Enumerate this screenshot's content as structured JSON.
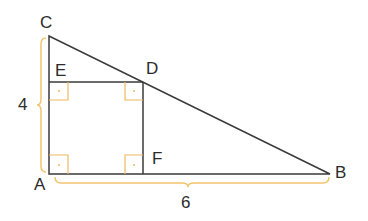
{
  "diagram": {
    "points": {
      "A": {
        "label": "A",
        "x": 49,
        "y": 174
      },
      "B": {
        "label": "B",
        "x": 330,
        "y": 174
      },
      "C": {
        "label": "C",
        "x": 49,
        "y": 36
      },
      "D": {
        "label": "D",
        "x": 143,
        "y": 82
      },
      "E": {
        "label": "E",
        "x": 49,
        "y": 82
      },
      "F": {
        "label": "F",
        "x": 143,
        "y": 174
      }
    },
    "dimensions": {
      "AC": "4",
      "AB": "6"
    },
    "colors": {
      "line": "#3a3a3a",
      "brace": "#f2c46d",
      "right_angle": "#f0b860"
    }
  }
}
